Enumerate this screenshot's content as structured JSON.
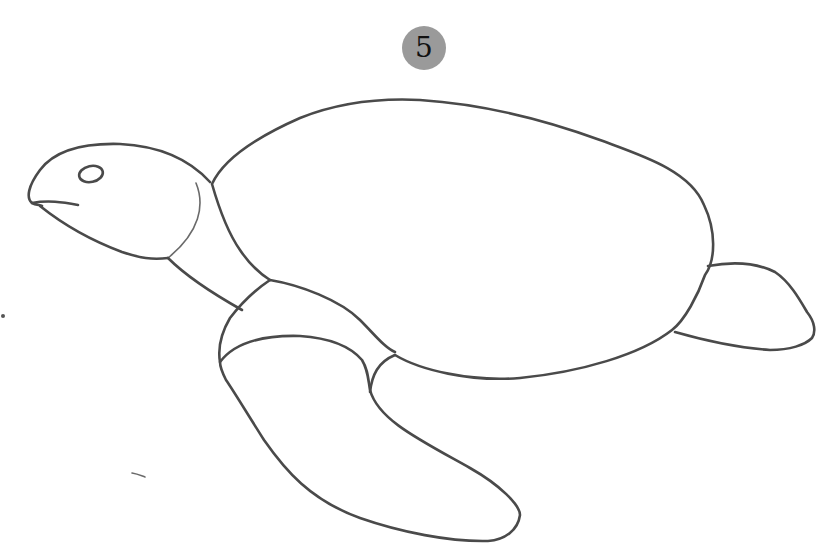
{
  "step": {
    "number": "5",
    "badge_color": "#9a9a9a"
  },
  "illustration": {
    "subject": "sea turtle outline sketch",
    "line_color": "#4a4a4a",
    "parts": [
      "head",
      "eye",
      "mouth",
      "neck",
      "shell",
      "front-flipper",
      "front-flipper-joint",
      "rear-flipper"
    ]
  }
}
